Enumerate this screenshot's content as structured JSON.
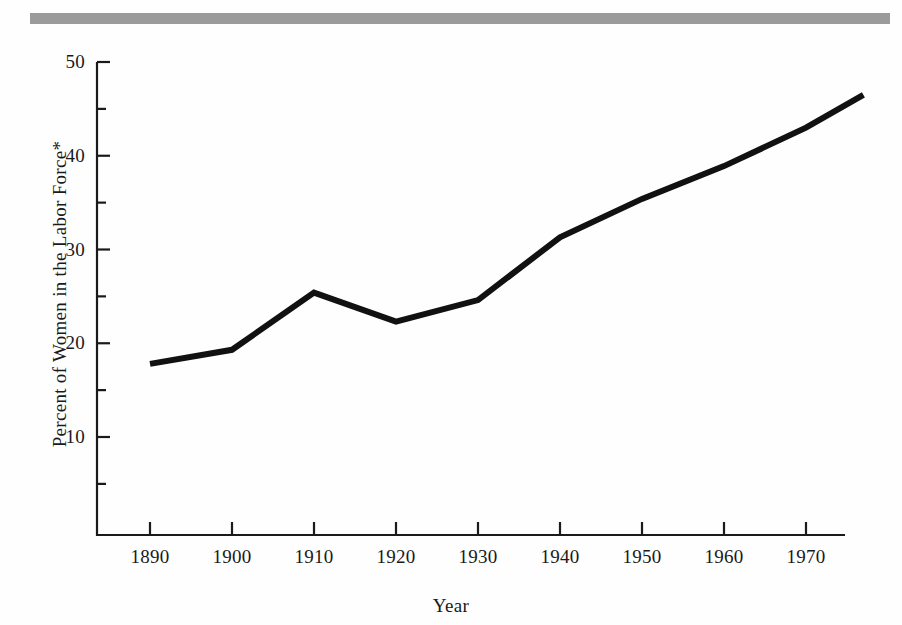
{
  "figure": {
    "top_rule_color": "#9b9b9b",
    "background_color": "#fefefe",
    "line_color": "#111111"
  },
  "chart_data": {
    "type": "line",
    "title": "",
    "xlabel": "Year",
    "ylabel": "Percent of Women in the Labor Force*",
    "xlim": [
      1885,
      1979
    ],
    "ylim": [
      0,
      50
    ],
    "grid": false,
    "legend": "none",
    "x_ticks": [
      1890,
      1900,
      1910,
      1920,
      1930,
      1940,
      1950,
      1960,
      1970
    ],
    "x_tick_labels": [
      "1890",
      "1900",
      "1910",
      "1920",
      "1930",
      "1940",
      "1950",
      "1960",
      "1970"
    ],
    "y_ticks": [
      5,
      10,
      15,
      20,
      25,
      30,
      35,
      40,
      45,
      50
    ],
    "y_tick_labels": [
      "",
      "10",
      "",
      "20",
      "",
      "30",
      "",
      "40",
      "",
      "50"
    ],
    "y_major_ticks": [
      10,
      20,
      30,
      40,
      50
    ],
    "y_minor_ticks": [
      5,
      15,
      25,
      35,
      45
    ],
    "series": [
      {
        "name": "Percent of women in the labor force",
        "x": [
          1890,
          1900,
          1910,
          1920,
          1930,
          1940,
          1950,
          1960,
          1970,
          1977
        ],
        "values": [
          17.8,
          19.3,
          25.4,
          22.3,
          24.6,
          31.3,
          35.4,
          38.9,
          43.0,
          46.5
        ]
      }
    ],
    "footnote_marker": "*"
  }
}
